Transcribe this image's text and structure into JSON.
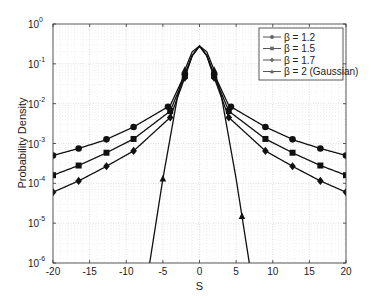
{
  "chart_data": {
    "type": "line",
    "title": "",
    "xlabel": "S",
    "ylabel": "Probability Density",
    "xlim": [
      -20,
      20
    ],
    "ylim": [
      1e-06,
      1
    ],
    "yscale": "log",
    "grid": true,
    "legend_position": "upper right",
    "x_ticks": [
      "-20",
      "-15",
      "-10",
      "-5",
      "0",
      "5",
      "10",
      "15",
      "20"
    ],
    "y_ticks": [
      {
        "base": "10",
        "exp": "0"
      },
      {
        "base": "10",
        "exp": "-1"
      },
      {
        "base": "10",
        "exp": "-2"
      },
      {
        "base": "10",
        "exp": "-3"
      },
      {
        "base": "10",
        "exp": "-4"
      },
      {
        "base": "10",
        "exp": "-5"
      },
      {
        "base": "10",
        "exp": "-6"
      }
    ],
    "series": [
      {
        "name": "β = 1.2",
        "marker": "circle",
        "x": [
          -20,
          -16.5,
          -13,
          -9,
          -4,
          -2,
          -1,
          0,
          1,
          2,
          4,
          9,
          13,
          16.5,
          20
        ],
        "values": [
          0.0005,
          0.00075,
          0.0012,
          0.0026,
          0.009,
          0.055,
          0.16,
          0.28,
          0.16,
          0.055,
          0.009,
          0.0026,
          0.0012,
          0.00075,
          0.0005
        ],
        "marker_x": [
          -20,
          -16.5,
          -12.7,
          -9,
          -4.3,
          -2,
          2,
          4.3,
          9,
          12.7,
          16.5,
          20
        ]
      },
      {
        "name": "β = 1.5",
        "marker": "square",
        "x": [
          -20,
          -16.5,
          -13,
          -9,
          -4,
          -2,
          -1,
          0,
          1,
          2,
          4,
          9,
          13,
          16.5,
          20
        ],
        "values": [
          0.00016,
          0.00028,
          0.00055,
          0.0013,
          0.0065,
          0.05,
          0.16,
          0.28,
          0.16,
          0.05,
          0.0065,
          0.0013,
          0.00055,
          0.00028,
          0.00016
        ],
        "marker_x": [
          -20,
          -16.5,
          -12.7,
          -9,
          -4,
          -2,
          2,
          4,
          9,
          12.7,
          16.5,
          20
        ]
      },
      {
        "name": "β = 1.7",
        "marker": "diamond",
        "x": [
          -20,
          -16.5,
          -13,
          -9,
          -4,
          -2,
          -1,
          0,
          1,
          2,
          4,
          9,
          13,
          16.5,
          20
        ],
        "values": [
          6e-05,
          0.000115,
          0.00025,
          0.00065,
          0.0045,
          0.045,
          0.16,
          0.28,
          0.16,
          0.045,
          0.0045,
          0.00065,
          0.00025,
          0.000115,
          6e-05
        ],
        "marker_x": [
          -20,
          -16.5,
          -12.7,
          -9,
          -4,
          -2,
          2,
          4,
          9,
          12.7,
          16.5,
          20
        ]
      },
      {
        "name": "β = 2 (Gaussian)",
        "marker": "triangle",
        "x": [
          -6.8,
          -5,
          -3,
          -2,
          -1,
          0,
          1,
          2,
          3,
          5,
          6.8
        ],
        "values": [
          1e-06,
          0.00013,
          0.015,
          0.07,
          0.2,
          0.28,
          0.2,
          0.07,
          0.015,
          0.00013,
          1e-06
        ],
        "marker_x": [
          -5,
          -2,
          2,
          5.8
        ]
      }
    ]
  }
}
